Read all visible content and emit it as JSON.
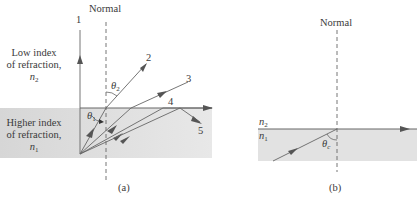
{
  "panel_a": {
    "normal_label": "Normal",
    "upper_medium": {
      "line1": "Low index",
      "line2": "of refraction,",
      "symbol": "n",
      "subscript": "2"
    },
    "lower_medium": {
      "line1": "Higher index",
      "line2": "of refraction,",
      "symbol": "n",
      "subscript": "1"
    },
    "rays": [
      {
        "id": "1",
        "label": "1"
      },
      {
        "id": "2",
        "label": "2"
      },
      {
        "id": "3",
        "label": "3"
      },
      {
        "id": "4",
        "label": "4"
      },
      {
        "id": "5",
        "label": "5"
      }
    ],
    "angle_incident": {
      "symbol": "θ",
      "subscript": "1"
    },
    "angle_refracted": {
      "symbol": "θ",
      "subscript": "2"
    },
    "caption": "(a)"
  },
  "panel_b": {
    "normal_label": "Normal",
    "upper_index": {
      "symbol": "n",
      "subscript": "2"
    },
    "lower_index": {
      "symbol": "n",
      "subscript": "1"
    },
    "critical_angle": {
      "symbol": "θ",
      "subscript": "c"
    },
    "caption": "(b)"
  },
  "colors": {
    "shade": "#dcdcdc",
    "line": "#555555",
    "text": "#3a3a3a"
  }
}
